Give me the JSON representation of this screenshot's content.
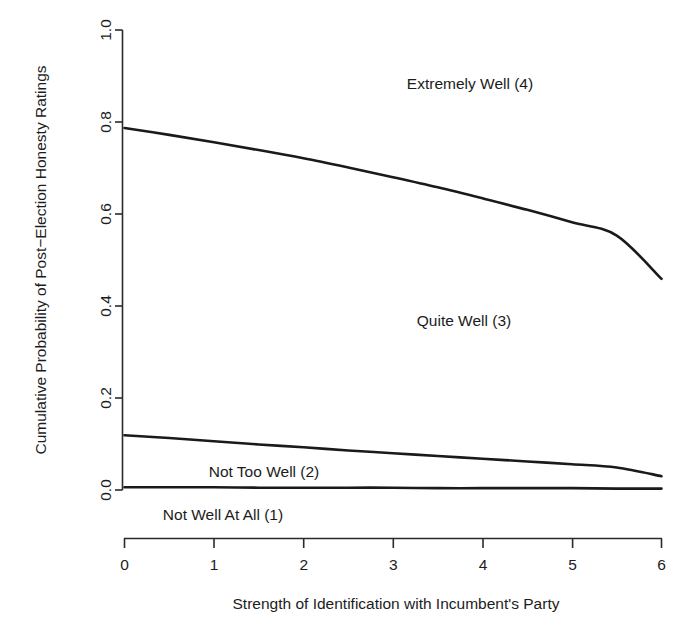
{
  "chart_data": {
    "type": "line",
    "title": "",
    "subtitle": "",
    "xlabel": "Strength of Identification with Incumbent's Party",
    "ylabel": "Cumulative Probability of Post−Election Honesty Ratings",
    "xlim": [
      0,
      6
    ],
    "ylim": [
      0.0,
      1.0
    ],
    "xticks": [
      "0",
      "1",
      "2",
      "3",
      "4",
      "5",
      "6"
    ],
    "xtick_values": [
      0,
      1,
      2,
      3,
      4,
      5,
      6
    ],
    "yticks": [
      "0.0",
      "0.2",
      "0.4",
      "0.6",
      "0.8",
      "1.0"
    ],
    "ytick_values": [
      0.0,
      0.2,
      0.4,
      0.6,
      0.8,
      1.0
    ],
    "grid": false,
    "legend": "none",
    "line_color": "#1a1a1a",
    "background_color": "#ffffff",
    "x": [
      0,
      0.5,
      1,
      1.5,
      2,
      2.5,
      3,
      3.5,
      4,
      4.5,
      5,
      5.5,
      6
    ],
    "series": [
      {
        "name": "Cumulative P(rating <= 3) boundary",
        "boundary_between": "Quite Well (3) / Extremely Well (4)",
        "values": [
          0.787,
          0.772,
          0.756,
          0.739,
          0.721,
          0.701,
          0.68,
          0.658,
          0.634,
          0.609,
          0.582,
          0.553,
          0.459
        ]
      },
      {
        "name": "Cumulative P(rating <= 2) boundary",
        "boundary_between": "Not Too Well (2) / Quite Well (3)",
        "values": [
          0.119,
          0.113,
          0.106,
          0.099,
          0.093,
          0.086,
          0.08,
          0.074,
          0.068,
          0.062,
          0.056,
          0.049,
          0.03
        ]
      },
      {
        "name": "Cumulative P(rating <= 1) boundary",
        "boundary_between": "Not Well At All (1) / Not Too Well (2)",
        "values": [
          0.006,
          0.006,
          0.006,
          0.005,
          0.005,
          0.005,
          0.005,
          0.004,
          0.004,
          0.004,
          0.004,
          0.003,
          0.003
        ]
      }
    ],
    "annotations": [
      {
        "text": "Extremely Well (4)",
        "x": 3.85,
        "y": 0.9
      },
      {
        "text": "Quite Well (3)",
        "x": 3.12,
        "y": 0.37
      },
      {
        "text": "Not Too Well (2)",
        "x": 1.45,
        "y": 0.048
      },
      {
        "text": "Not Well At All (1)",
        "x": 1.05,
        "y": -0.048
      }
    ]
  },
  "axes": {
    "x_title": "Strength of Identification with Incumbent's Party",
    "y_title": "Cumulative Probability of Post−Election Honesty Ratings",
    "x_tick_labels": [
      "0",
      "1",
      "2",
      "3",
      "4",
      "5",
      "6"
    ],
    "y_tick_labels": [
      "0.0",
      "0.2",
      "0.4",
      "0.6",
      "0.8",
      "1.0"
    ]
  },
  "labels": {
    "extremely_well": "Extremely Well (4)",
    "quite_well": "Quite Well (3)",
    "not_too_well": "Not Too Well (2)",
    "not_well_at_all": "Not Well At All (1)"
  }
}
